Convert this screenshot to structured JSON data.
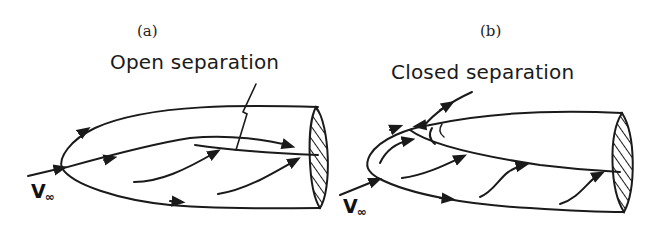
{
  "figure": {
    "panels": [
      {
        "id": "a",
        "label": "(a)",
        "caption": "Open separation",
        "freestream_label": "V",
        "freestream_subscript": "∞"
      },
      {
        "id": "b",
        "label": "(b)",
        "caption": "Closed separation",
        "freestream_label": "V",
        "freestream_subscript": "∞"
      }
    ],
    "colors": {
      "ink": "#1a1a1a",
      "background": "#ffffff"
    }
  }
}
